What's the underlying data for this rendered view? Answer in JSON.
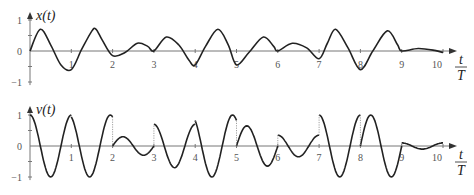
{
  "chart_data": [
    {
      "type": "line",
      "title": "x(t)",
      "ylabel": "x(t)",
      "xlabel": "t/T",
      "xlabel_num": "t",
      "xlabel_den": "T",
      "xlim": [
        0,
        10
      ],
      "ylim": [
        -1,
        1
      ],
      "x_ticks": [
        "1",
        "2",
        "3",
        "4",
        "5",
        "6",
        "7",
        "8",
        "9",
        "10"
      ],
      "y_ticks": [
        "1",
        "0",
        "−1"
      ],
      "grid": false,
      "legend": null,
      "series": [
        {
          "name": "x(t)",
          "x": [
            0,
            0.25,
            0.5,
            0.75,
            1,
            1.25,
            1.5,
            1.6,
            1.75,
            2,
            2.3,
            2.6,
            2.85,
            3,
            3.3,
            3.6,
            3.85,
            4,
            4.25,
            4.55,
            4.8,
            5,
            5.3,
            5.65,
            5.9,
            6,
            6.35,
            6.7,
            7,
            7.2,
            7.4,
            7.7,
            8,
            8.3,
            8.65,
            8.9,
            9,
            9.4,
            9.8,
            10
          ],
          "y": [
            0,
            0.7,
            0.2,
            -0.45,
            -0.6,
            0.05,
            0.65,
            0.7,
            0.35,
            -0.15,
            -0.05,
            0.25,
            0.15,
            0,
            0.45,
            0.2,
            -0.3,
            -0.45,
            0.15,
            0.7,
            0.2,
            -0.45,
            -0.05,
            0.45,
            0.15,
            0,
            0.25,
            0.1,
            -0.25,
            0.25,
            0.7,
            0.1,
            -0.6,
            0,
            0.65,
            0.2,
            0,
            0.08,
            0.02,
            -0.05
          ]
        }
      ]
    },
    {
      "type": "line",
      "title": "v(t)",
      "ylabel": "v(t)",
      "xlabel": "t/T",
      "xlabel_num": "t",
      "xlabel_den": "T",
      "xlim": [
        0,
        10
      ],
      "ylim": [
        -1,
        1
      ],
      "x_ticks": [
        "1",
        "2",
        "3",
        "4",
        "5",
        "6",
        "7",
        "8",
        "9",
        "10"
      ],
      "y_ticks": [
        "1",
        "0",
        "−1"
      ],
      "grid": false,
      "legend": null,
      "note": "v(t) is discontinuous at integer t; dotted vertical lines mark jumps",
      "segments": [
        {
          "t0": 0,
          "v_start": 1.0,
          "amp": 1.0,
          "phase": 0
        },
        {
          "t0": 1,
          "v_start": 0.35,
          "amp": 1.0,
          "phase": 0.35
        },
        {
          "t0": 2,
          "v_start": 0.0,
          "amp": 0.3,
          "phase": -1.57
        },
        {
          "t0": 3,
          "v_start": 0.7,
          "amp": 0.7,
          "phase": 0
        },
        {
          "t0": 4,
          "v_start": 0.8,
          "amp": 1.0,
          "phase": 0.6
        },
        {
          "t0": 5,
          "v_start": 0.0,
          "amp": 0.65,
          "phase": -1.57
        },
        {
          "t0": 6,
          "v_start": 0.35,
          "amp": 0.35,
          "phase": 0
        },
        {
          "t0": 7,
          "v_start": 1.0,
          "amp": 1.0,
          "phase": 0
        },
        {
          "t0": 8,
          "v_start": 0.0,
          "amp": 1.0,
          "phase": -1.57
        },
        {
          "t0": 9,
          "v_start": 0.1,
          "amp": 0.1,
          "phase": 0
        }
      ]
    }
  ],
  "colors": {
    "curve": "#222222",
    "axis": "#777777"
  }
}
